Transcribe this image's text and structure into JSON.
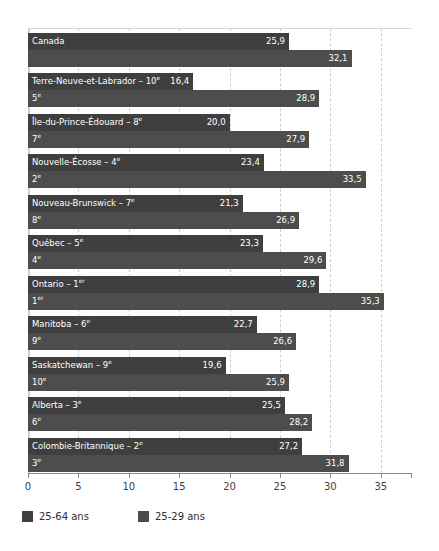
{
  "chart_data": {
    "type": "bar",
    "orientation": "horizontal",
    "title": "",
    "xlabel": "",
    "ylabel": "",
    "xlim": [
      0,
      38
    ],
    "xticks": [
      0,
      5,
      10,
      15,
      20,
      25,
      30,
      35
    ],
    "xtick_labels": [
      "0",
      "5",
      "10",
      "15",
      "20",
      "25",
      "30",
      "35"
    ],
    "grid": "vertical-dashed",
    "legend_position": "bottom-left",
    "categories": [
      "Canada",
      "Terre-Neuve-et-Labrador",
      "Île-du-Prince-Édouard",
      "Nouvelle-Écosse",
      "Nouveau-Brunswick",
      "Québec",
      "Ontario",
      "Manitoba",
      "Saskatchewan",
      "Alberta",
      "Colombie-Britannique"
    ],
    "series": [
      {
        "name": "25-64 ans",
        "color": "#3f3f3f",
        "values": [
          25.9,
          16.4,
          20.0,
          23.4,
          21.3,
          23.3,
          28.9,
          22.7,
          19.6,
          25.5,
          27.2
        ],
        "value_labels": [
          "25,9",
          "16,4",
          "20,0",
          "23,4",
          "21,3",
          "23,3",
          "28,9",
          "22,7",
          "19,6",
          "25,5",
          "27,2"
        ],
        "ranks": [
          "",
          "10",
          "8",
          "4",
          "7",
          "5",
          "1",
          "6",
          "9",
          "3",
          "2"
        ],
        "rank_suffix": [
          "",
          "e",
          "e",
          "e",
          "e",
          "e",
          "er",
          "e",
          "e",
          "e",
          "e"
        ]
      },
      {
        "name": "25-29 ans",
        "color": "#4d4d4d",
        "values": [
          32.1,
          28.9,
          27.9,
          33.5,
          26.9,
          29.6,
          35.3,
          26.6,
          25.9,
          28.2,
          31.8
        ],
        "value_labels": [
          "32,1",
          "28,9",
          "27,9",
          "33,5",
          "26,9",
          "29,6",
          "35,3",
          "26,6",
          "25,9",
          "28,2",
          "31,8"
        ],
        "ranks": [
          "",
          "5",
          "7",
          "2",
          "8",
          "4",
          "1",
          "9",
          "10",
          "6",
          "3"
        ],
        "rank_suffix": [
          "",
          "e",
          "e",
          "e",
          "e",
          "e",
          "er",
          "e",
          "e",
          "e",
          "e"
        ]
      }
    ],
    "row_labels": [
      {
        "name": "Canada",
        "rank": "",
        "suffix": ""
      },
      {
        "name": "Terre-Neuve-et-Labrador",
        "rank": "10",
        "suffix": "e"
      },
      {
        "name": "Île-du-Prince-Édouard",
        "rank": "8",
        "suffix": "e"
      },
      {
        "name": "Nouvelle-Écosse",
        "rank": "4",
        "suffix": "e"
      },
      {
        "name": "Nouveau-Brunswick",
        "rank": "7",
        "suffix": "e"
      },
      {
        "name": "Québec",
        "rank": "5",
        "suffix": "e"
      },
      {
        "name": "Ontario",
        "rank": "1",
        "suffix": "er"
      },
      {
        "name": "Manitoba",
        "rank": "6",
        "suffix": "e"
      },
      {
        "name": "Saskatchewan",
        "rank": "9",
        "suffix": "e"
      },
      {
        "name": "Alberta",
        "rank": "3",
        "suffix": "e"
      },
      {
        "name": "Colombie-Britannique",
        "rank": "2",
        "suffix": "e"
      }
    ]
  },
  "legend": {
    "items": [
      {
        "label": "25-64 ans",
        "color": "#3f3f3f"
      },
      {
        "label": "25-29 ans",
        "color": "#4d4d4d"
      }
    ]
  },
  "colors": {
    "series_25_64": "#3f3f3f",
    "series_25_29": "#4d4d4d",
    "gridline": "#cfcfcf",
    "axis": "#8a8a8a",
    "tick_text": "#3f3f3f",
    "bar_text": "#ffffff",
    "background": "#ffffff"
  }
}
